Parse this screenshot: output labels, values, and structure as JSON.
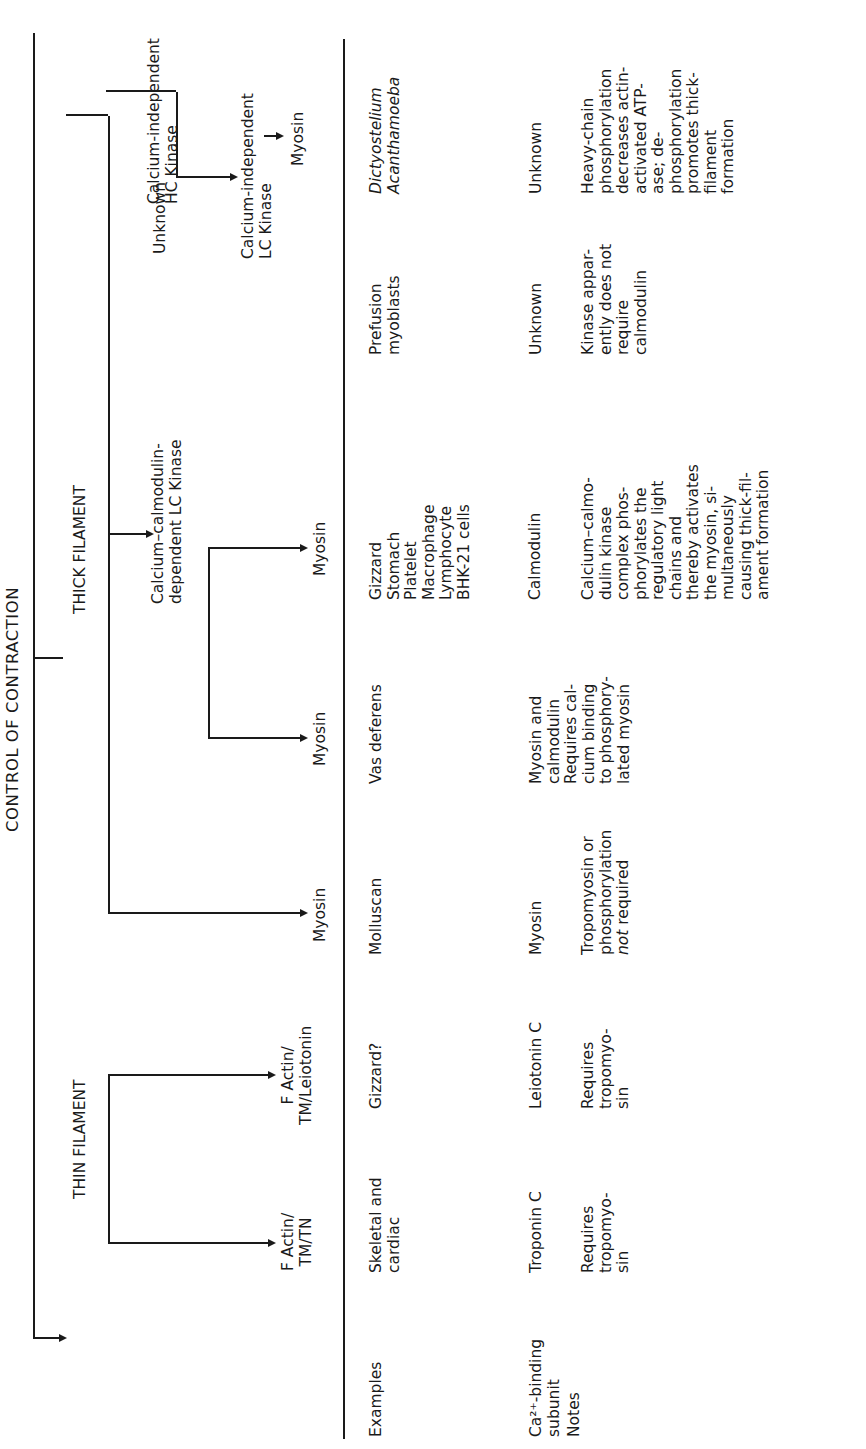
{
  "title": "CONTROL OF CONTRACTION",
  "branches": {
    "thin": "THIN FILAMENT",
    "thick": "THICK FILAMENT"
  },
  "kinases": {
    "ca_calmodulin": "Calcium–calmodulin-\ndependent LC Kinase",
    "unknown": "Unknown",
    "ca_indep_lc": "Calcium-independent\nLC Kinase",
    "ca_indep_hc": "Calcium-independent\nHC Kinase"
  },
  "row_labels": {
    "examples": "Examples",
    "ca_binding": "Ca²⁺-binding\nsubunit",
    "notes": "Notes"
  },
  "columns": [
    {
      "header": "F Actin/\nTM/TN",
      "examples": "Skeletal and\ncardiac",
      "ca_binding": "Troponin C",
      "notes": "Requires\ntropomyo-\nsin"
    },
    {
      "header": "F Actin/\nTM/Leiotonin",
      "examples": "Gizzard?",
      "ca_binding": "Leiotonin C",
      "notes": "Requires\ntropomyo-\nsin"
    },
    {
      "header": "Myosin",
      "examples": "Molluscan",
      "ca_binding": "Myosin",
      "notes_pre": "Tropomyosin or\nphosphorylation\n",
      "notes_italic": "not",
      "notes_post": " required"
    },
    {
      "header": "Myosin",
      "examples": "Vas deferens",
      "ca_binding": "Myosin and\ncalmodulin",
      "notes": "Requires cal-\ncium binding\nto phosphory-\nlated myosin"
    },
    {
      "header": "Myosin",
      "examples": "Gizzard\nStomach\nPlatelet\nMacrophage\nLymphocyte\nBHK-21 cells",
      "ca_binding": "Calmodulin",
      "notes": "Calcium–calmo-\ndulin kinase\ncomplex phos-\nphorylates the\nregulatory light\nchains and\nthereby activates\nthe myosin, si-\nmultaneously\ncausing thick-fil-\nament formation"
    },
    {
      "header": "Myosin",
      "examples": "Prefusion\nmyoblasts",
      "ca_binding": "Unknown",
      "notes": "Kinase appar-\nently does not\nrequire\ncalmodulin"
    },
    {
      "header": "Myosin",
      "examples_italic_1": "Dictyostelium",
      "examples_italic_2": "Acanthamoeba",
      "ca_binding": "Unknown",
      "notes": "Heavy-chain\nphosphorylation\ndecreases actin-\nactivated ATP-\nase; de-\nphosphorylation\npromotes thick-\nfilament\nformation"
    }
  ]
}
